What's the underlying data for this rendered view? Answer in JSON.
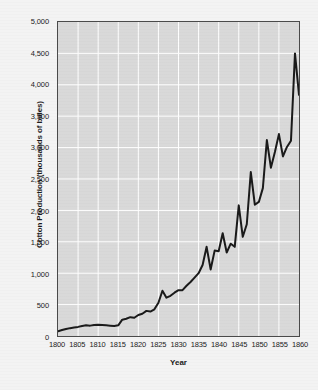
{
  "chart_data": {
    "type": "line",
    "title": "",
    "xlabel": "Year",
    "ylabel": "Cotton Production (thousands of bales)",
    "xlim": [
      1800,
      1860
    ],
    "ylim": [
      0,
      5000
    ],
    "grid": true,
    "legend": "none",
    "line_color": "#1a1a1a",
    "plot_bg_color": "#d9d9d9",
    "gridline_color": "#ffffff",
    "figure_bg_color": "#f3f3f3",
    "axis_color": "#4a4a4a",
    "y_ticks": [
      "0",
      "500",
      "1,000",
      "1,500",
      "2,000",
      "2,500",
      "3,000",
      "3,500",
      "4,000",
      "4,500",
      "5,000"
    ],
    "y_tick_values": [
      0,
      500,
      1000,
      1500,
      2000,
      2500,
      3000,
      3500,
      4000,
      4500,
      5000
    ],
    "x_ticks": [
      "1800",
      "1805",
      "1810",
      "1815",
      "1820",
      "1825",
      "1830",
      "1835",
      "1840",
      "1845",
      "1850",
      "1855",
      "1860"
    ],
    "x_tick_values": [
      1800,
      1805,
      1810,
      1815,
      1820,
      1825,
      1830,
      1835,
      1840,
      1845,
      1850,
      1855,
      1860
    ],
    "x": [
      1800,
      1801,
      1802,
      1803,
      1804,
      1805,
      1806,
      1807,
      1808,
      1809,
      1810,
      1811,
      1812,
      1813,
      1814,
      1815,
      1816,
      1817,
      1818,
      1819,
      1820,
      1821,
      1822,
      1823,
      1824,
      1825,
      1826,
      1827,
      1828,
      1829,
      1830,
      1831,
      1832,
      1833,
      1834,
      1835,
      1836,
      1837,
      1838,
      1839,
      1840,
      1841,
      1842,
      1843,
      1844,
      1845,
      1846,
      1847,
      1848,
      1849,
      1850,
      1851,
      1852,
      1853,
      1854,
      1855,
      1856,
      1857,
      1858,
      1859,
      1860
    ],
    "values": [
      75,
      95,
      110,
      125,
      135,
      145,
      160,
      170,
      165,
      175,
      180,
      175,
      170,
      165,
      160,
      170,
      260,
      275,
      300,
      290,
      335,
      355,
      400,
      390,
      425,
      530,
      720,
      610,
      640,
      690,
      730,
      730,
      800,
      860,
      930,
      1000,
      1130,
      1420,
      1060,
      1360,
      1350,
      1635,
      1330,
      1470,
      1420,
      2080,
      1580,
      1780,
      2610,
      2090,
      2135,
      2355,
      3120,
      2680,
      2930,
      3215,
      2860,
      3010,
      3110,
      4500,
      3840
    ]
  },
  "axes": {
    "y_title": "Cotton Production (thousands of bales)",
    "x_title": "Year"
  }
}
